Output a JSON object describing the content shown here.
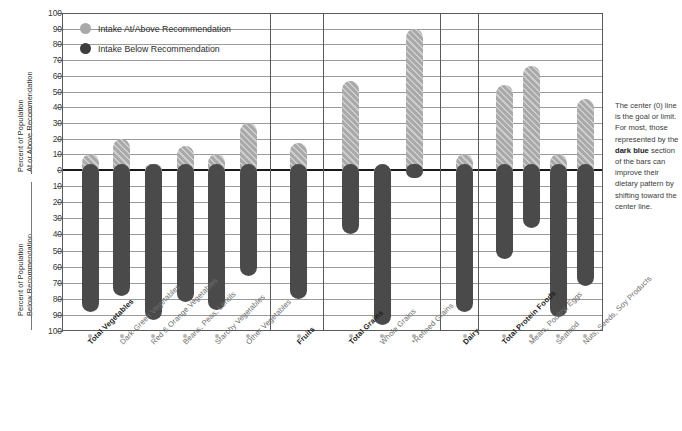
{
  "axes": {
    "upper_title_line1": "Percent of Population",
    "upper_title_line2": "At or Above Recommendation",
    "lower_title_line1": "Percent of Population",
    "lower_title_line2": "Below Recommendation",
    "upper_ticks": [
      "100",
      "90",
      "80",
      "70",
      "60",
      "50",
      "40",
      "30",
      "20",
      "10",
      "0"
    ],
    "lower_ticks": [
      "10",
      "20",
      "30",
      "40",
      "50",
      "60",
      "70",
      "80",
      "90",
      "100"
    ]
  },
  "legend": {
    "items": [
      {
        "label": "Intake At/Above Recommendation",
        "color": "#a9a9a9",
        "icon": "circle-marker-icon"
      },
      {
        "label": "Intake Below Recommendation",
        "color": "#3d3d3d",
        "icon": "circle-marker-icon"
      }
    ]
  },
  "sidenote": {
    "part1": "The center (0) line is the goal or limit. For most, those represented by the ",
    "emphasis": "dark blue",
    "part2": " section of the bars can improve their dietary pattern by shifting toward the center line."
  },
  "chart_data": {
    "type": "bar",
    "title": "",
    "xlabel": "",
    "ylabel": "Percent of Population",
    "ylim": [
      -100,
      100
    ],
    "grid": true,
    "legend_position": "top-left",
    "categories": [
      "Total Vegetables",
      "Dark-Green Vegetables",
      "Red & Orange Vegetables",
      "Beans, Peas, Lentils",
      "Starchy Vegetables",
      "Other Vegetables",
      "Fruits",
      "Total Grains",
      "Whole Grains",
      "*Refined Grains",
      "Dairy",
      "Total Protein Foods",
      "Meats, Poultry, Eggs",
      "Seafood",
      "Nuts, Seeds, Soy Products"
    ],
    "category_bold": [
      true,
      false,
      false,
      false,
      false,
      false,
      true,
      true,
      false,
      false,
      true,
      true,
      false,
      false,
      false
    ],
    "groups": [
      {
        "name": "Vegetables",
        "start": 0,
        "end": 5
      },
      {
        "name": "Fruits",
        "start": 6,
        "end": 6
      },
      {
        "name": "Grains",
        "start": 7,
        "end": 9
      },
      {
        "name": "Dairy",
        "start": 10,
        "end": 10
      },
      {
        "name": "Protein Foods",
        "start": 11,
        "end": 14
      }
    ],
    "series": [
      {
        "name": "Intake At/Above Recommendation",
        "color": "#a9a9a9",
        "values": [
          10,
          20,
          4,
          15,
          10,
          30,
          17,
          57,
          2,
          90,
          10,
          54,
          66,
          10,
          45
        ]
      },
      {
        "name": "Intake Below Recommendation",
        "color": "#4a4a4a",
        "values": [
          -88,
          -78,
          -93,
          -82,
          -87,
          -66,
          -80,
          -40,
          -96,
          -5,
          -88,
          -55,
          -36,
          -91,
          -72
        ]
      }
    ]
  }
}
